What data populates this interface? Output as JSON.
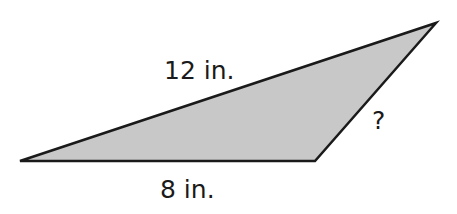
{
  "diagram": {
    "shape": "triangle",
    "fill_color": "#c8c8c8",
    "stroke_color": "#1a1a1a",
    "vertices": [
      [
        20,
        161
      ],
      [
        315,
        161
      ],
      [
        436,
        23
      ]
    ],
    "labels": {
      "long_side": "12 in.",
      "base": "8 in.",
      "unknown_side": "?"
    }
  }
}
